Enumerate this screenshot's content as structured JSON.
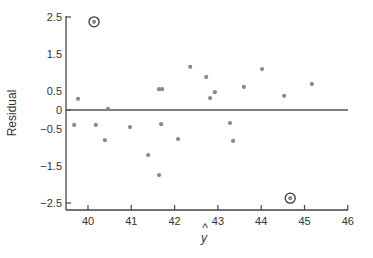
{
  "chart_data": {
    "type": "scatter",
    "title": "",
    "xlabel": "ŷ",
    "ylabel": "Residual",
    "xlim": [
      39.5,
      46
    ],
    "ylim": [
      -2.65,
      2.5
    ],
    "x_ticks": [
      40,
      41,
      42,
      43,
      44,
      45,
      46
    ],
    "x_tick_labels": [
      "40",
      "41",
      "42",
      "43",
      "44",
      "45",
      "46"
    ],
    "y_ticks": [
      2.5,
      1.5,
      0.5,
      0,
      -0.5,
      -1.5,
      -2.5
    ],
    "y_tick_labels": [
      "2.5",
      "1.5",
      "0.5",
      "0",
      "−0.5",
      "−1.5",
      "−2.5"
    ],
    "grid": false,
    "legend": null,
    "reference_line": {
      "y": 0,
      "x_from": 39.5,
      "x_to": 46,
      "color": "#555555"
    },
    "marker_color": "#8a8a8a",
    "points": [
      {
        "x": 39.68,
        "y": -0.4
      },
      {
        "x": 39.77,
        "y": 0.3
      },
      {
        "x": 40.14,
        "y": 2.37,
        "circled": true
      },
      {
        "x": 40.18,
        "y": -0.4
      },
      {
        "x": 40.39,
        "y": -0.81
      },
      {
        "x": 40.46,
        "y": 0.03
      },
      {
        "x": 40.97,
        "y": -0.46
      },
      {
        "x": 41.39,
        "y": -1.21
      },
      {
        "x": 41.64,
        "y": -1.75
      },
      {
        "x": 41.64,
        "y": 0.56
      },
      {
        "x": 41.69,
        "y": -0.38
      },
      {
        "x": 41.71,
        "y": 0.56
      },
      {
        "x": 42.08,
        "y": -0.78
      },
      {
        "x": 42.36,
        "y": 1.16
      },
      {
        "x": 42.73,
        "y": 0.89
      },
      {
        "x": 42.82,
        "y": 0.32
      },
      {
        "x": 42.93,
        "y": 0.48
      },
      {
        "x": 43.28,
        "y": -0.35
      },
      {
        "x": 43.35,
        "y": -0.83
      },
      {
        "x": 43.6,
        "y": 0.62
      },
      {
        "x": 44.02,
        "y": 1.1
      },
      {
        "x": 44.53,
        "y": 0.38
      },
      {
        "x": 44.67,
        "y": -2.37,
        "circled": true
      },
      {
        "x": 45.17,
        "y": 0.7
      }
    ],
    "annotations": [
      "Two outlier points circled: (40.14, 2.37) and (44.67, -2.37)"
    ]
  },
  "layout": {
    "plot_left": 66,
    "plot_right": 348,
    "plot_top": 16,
    "plot_bottom": 210,
    "x0_px": 88,
    "x_px_per_unit": 43.3,
    "y0_px": 110,
    "y_px_per_unit": 37.2
  }
}
